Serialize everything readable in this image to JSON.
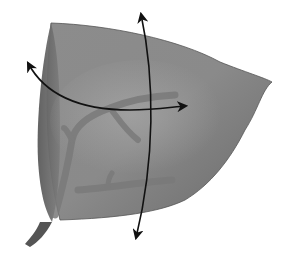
{
  "diagram": {
    "colors": {
      "background": "#ffffff",
      "body_light": "#9a9a9a",
      "body_mid": "#858585",
      "body_dark": "#5e5e5e",
      "face_left": "#6e6e6e",
      "vessel": "#7a7a7a",
      "stem": "#555555",
      "arrow": "#111111"
    },
    "arrows": [
      {
        "name": "horizontal-curved-axis",
        "from": [
          28,
          63
        ],
        "to": [
          186,
          106
        ]
      },
      {
        "name": "vertical-curved-axis",
        "from": [
          141,
          14
        ],
        "to": [
          136,
          238
        ]
      }
    ]
  }
}
